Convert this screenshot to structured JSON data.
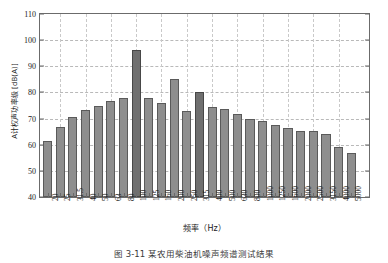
{
  "chart_data": {
    "type": "bar",
    "title": "",
    "xlabel": "频率（Hz）",
    "ylabel": "A计权声功率级 [dB(A)]",
    "ylim": [
      40,
      110
    ],
    "ytick_values": [
      40,
      50,
      60,
      70,
      80,
      90,
      100,
      110
    ],
    "ytick_labels": [
      "40",
      "50",
      "60",
      "70",
      "80",
      "90",
      "100",
      "110"
    ],
    "grid": true,
    "legend": "none",
    "categories": [
      "20",
      "25",
      "31.5",
      "40",
      "50",
      "63",
      "80",
      "100",
      "125",
      "160",
      "200",
      "250",
      "315",
      "400",
      "500",
      "630",
      "800",
      "1000",
      "1250",
      "1600",
      "2000",
      "2500",
      "3150",
      "4000",
      "5000"
    ],
    "values": [
      61.6,
      66.8,
      70.7,
      73.4,
      74.8,
      76.7,
      77.8,
      96.2,
      77.8,
      76.1,
      85.0,
      72.8,
      80.3,
      74.6,
      73.7,
      71.7,
      70.0,
      69.2,
      67.7,
      66.4,
      65.1,
      65.1,
      64.0,
      59.2,
      56.7
    ],
    "highlighted_categories": [
      "100",
      "315"
    ],
    "bar_color": "#8e8e8e",
    "bar_highlight_color": "#6f6f6f",
    "bar_edge_color": "#5a5a5a",
    "grid_color": "#b9b9b9",
    "axis_color": "#6b6b6b"
  },
  "caption": {
    "text": "图 3-11  某农用柴油机噪声频谱测试结果"
  }
}
